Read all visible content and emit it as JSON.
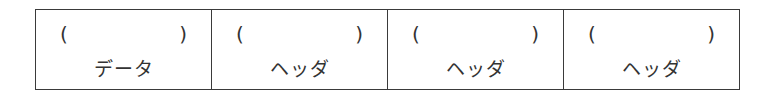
{
  "cells": [
    {
      "open": "(",
      "close": ")",
      "label": "データ"
    },
    {
      "open": "(",
      "close": ")",
      "label": "ヘッダ"
    },
    {
      "open": "(",
      "close": ")",
      "label": "ヘッダ"
    },
    {
      "open": "(",
      "close": ")",
      "label": "ヘッダ"
    }
  ]
}
